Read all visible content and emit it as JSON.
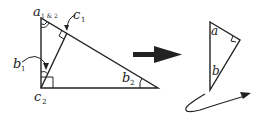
{
  "diagram": {
    "left_triangle": {
      "labels": {
        "a": {
          "main": "a",
          "sub": "1 & 2"
        },
        "c1": {
          "main": "c",
          "sub": "1"
        },
        "b1": {
          "main": "b",
          "sub": "1"
        },
        "c2": {
          "main": "c",
          "sub": "2"
        },
        "b2": {
          "main": "b",
          "sub": "2"
        }
      }
    },
    "right_triangle": {
      "labels": {
        "a": "a",
        "b": "b"
      }
    },
    "colors": {
      "stroke": "#222222",
      "background": "#ffffff"
    }
  }
}
